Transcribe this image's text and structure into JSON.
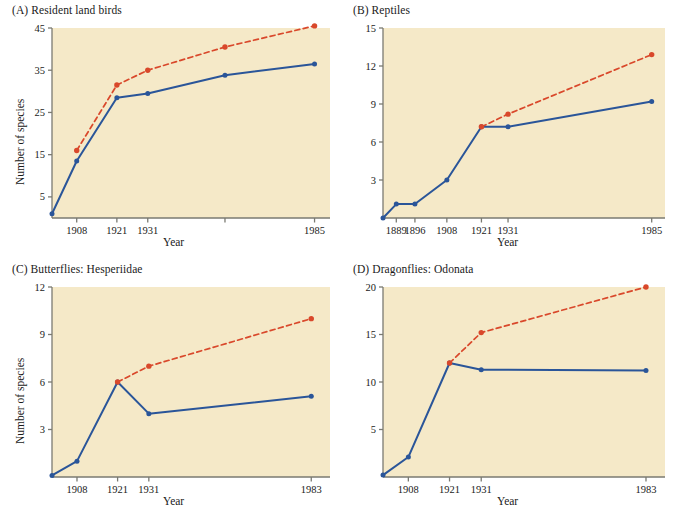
{
  "figure": {
    "background": "#ffffff",
    "plot_background": "#f5e9c8",
    "series_colors": {
      "observed": "#2a5599",
      "cumulative": "#d9482b"
    },
    "axis_label_y": "Number of species",
    "axis_label_x": "Year"
  },
  "chart_data": [
    {
      "type": "line",
      "panel": "A",
      "title": "(A)  Resident land birds",
      "xlabel": "Year",
      "ylabel": "Number of species",
      "ylim": [
        0,
        45
      ],
      "yticks": [
        5,
        15,
        25,
        35,
        45
      ],
      "xlim": [
        1900,
        1990
      ],
      "xticks": [
        1908,
        1921,
        1931,
        1956,
        1985
      ],
      "xticklabels": [
        "1908",
        "1921",
        "1931",
        "",
        "1985"
      ],
      "grid": false,
      "legend": "none",
      "series": [
        {
          "name": "observed",
          "color": "#2a5599",
          "style": "solid",
          "x": [
            1900,
            1908,
            1921,
            1931,
            1956,
            1985
          ],
          "values": [
            1,
            13.5,
            28.5,
            29.5,
            33.8,
            36.5
          ]
        },
        {
          "name": "cumulative",
          "color": "#d9482b",
          "style": "dashed",
          "x": [
            1908,
            1921,
            1931,
            1956,
            1985
          ],
          "values": [
            16,
            31.5,
            35,
            40.5,
            45.5
          ]
        }
      ]
    },
    {
      "type": "line",
      "panel": "B",
      "title": "(B)  Reptiles",
      "xlabel": "Year",
      "ylabel": "",
      "ylim": [
        0,
        15
      ],
      "yticks": [
        3,
        6,
        9,
        12,
        15
      ],
      "xlim": [
        1884,
        1990
      ],
      "xticks": [
        1889,
        1896,
        1908,
        1921,
        1931,
        1985
      ],
      "xticklabels": [
        "1889",
        "1896",
        "1908",
        "1921",
        "1931",
        "1985"
      ],
      "grid": false,
      "legend": "none",
      "series": [
        {
          "name": "observed",
          "color": "#2a5599",
          "style": "solid",
          "x": [
            1884,
            1889,
            1896,
            1908,
            1921,
            1931,
            1985
          ],
          "values": [
            0,
            1.1,
            1.1,
            3.0,
            7.2,
            7.2,
            9.2
          ]
        },
        {
          "name": "cumulative",
          "color": "#d9482b",
          "style": "dashed",
          "x": [
            1921,
            1931,
            1985
          ],
          "values": [
            7.2,
            8.2,
            12.9
          ]
        }
      ]
    },
    {
      "type": "line",
      "panel": "C",
      "title": "(C)  Butterflies: Hesperiidae",
      "xlabel": "Year",
      "ylabel": "Number of species",
      "ylim": [
        0,
        12
      ],
      "yticks": [
        3,
        6,
        9,
        12
      ],
      "xlim": [
        1900,
        1989
      ],
      "xticks": [
        1908,
        1921,
        1931,
        1983
      ],
      "xticklabels": [
        "1908",
        "1921",
        "1931",
        "1983"
      ],
      "grid": false,
      "legend": "none",
      "series": [
        {
          "name": "observed",
          "color": "#2a5599",
          "style": "solid",
          "x": [
            1900,
            1908,
            1921,
            1931,
            1983
          ],
          "values": [
            0.1,
            1.0,
            6.0,
            4.0,
            5.1
          ]
        },
        {
          "name": "cumulative",
          "color": "#d9482b",
          "style": "dashed",
          "x": [
            1921,
            1931,
            1983
          ],
          "values": [
            6.0,
            7.0,
            10.0
          ]
        }
      ]
    },
    {
      "type": "line",
      "panel": "D",
      "title": "(D)  Dragonflies: Odonata",
      "xlabel": "Year",
      "ylabel": "",
      "ylim": [
        0,
        20
      ],
      "yticks": [
        5,
        10,
        15,
        20
      ],
      "xlim": [
        1900,
        1989
      ],
      "xticks": [
        1908,
        1921,
        1931,
        1983
      ],
      "xticklabels": [
        "1908",
        "1921",
        "1931",
        "1983"
      ],
      "grid": false,
      "legend": "none",
      "series": [
        {
          "name": "observed",
          "color": "#2a5599",
          "style": "solid",
          "x": [
            1900,
            1908,
            1921,
            1931,
            1983
          ],
          "values": [
            0.2,
            2.1,
            12.0,
            11.3,
            11.2
          ]
        },
        {
          "name": "cumulative",
          "color": "#d9482b",
          "style": "dashed",
          "x": [
            1921,
            1931,
            1983
          ],
          "values": [
            12.0,
            15.2,
            20.0
          ]
        }
      ]
    }
  ]
}
